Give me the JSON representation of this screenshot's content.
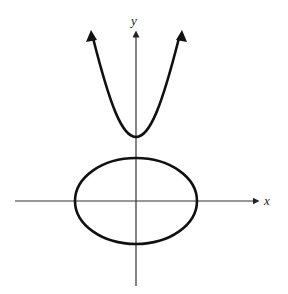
{
  "diagram": {
    "type": "conic-sections-graph",
    "axes": {
      "x_label": "x",
      "y_label": "y",
      "origin_px": [
        136,
        201
      ]
    },
    "curves": [
      {
        "kind": "parabola",
        "opens": "up",
        "vertex_px": [
          136,
          137
        ],
        "arrows": "both-ends"
      },
      {
        "kind": "ellipse",
        "center_px": [
          136,
          201
        ],
        "rx_px": 61,
        "ry_px": 43
      }
    ],
    "colors": {
      "stroke": "#111111",
      "axis": "#333333",
      "background": "#ffffff"
    }
  }
}
